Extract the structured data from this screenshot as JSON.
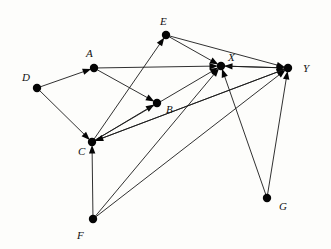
{
  "figure": {
    "type": "directed-graph",
    "width": 331,
    "height": 249,
    "background_color": "#fdfdfb",
    "node_color": "#050505",
    "edge_color": "#1a1a1a",
    "node_radius": 4.2,
    "label_style": "italic-serif"
  },
  "nodes": [
    {
      "id": "A",
      "label": "A",
      "x": 94,
      "y": 68,
      "label_x": 86,
      "label_y": 48
    },
    {
      "id": "B",
      "label": "B",
      "x": 157,
      "y": 103,
      "label_x": 166,
      "label_y": 104
    },
    {
      "id": "C",
      "label": "C",
      "x": 92,
      "y": 142,
      "label_x": 78,
      "label_y": 146
    },
    {
      "id": "D",
      "label": "D",
      "x": 37,
      "y": 88,
      "label_x": 22,
      "label_y": 72
    },
    {
      "id": "E",
      "label": "E",
      "x": 166,
      "y": 35,
      "label_x": 160,
      "label_y": 16
    },
    {
      "id": "F",
      "label": "F",
      "x": 93,
      "y": 219,
      "label_x": 77,
      "label_y": 230
    },
    {
      "id": "G",
      "label": "G",
      "x": 267,
      "y": 198,
      "label_x": 279,
      "label_y": 201
    },
    {
      "id": "X",
      "label": "X",
      "x": 221,
      "y": 66,
      "label_x": 228,
      "label_y": 52
    },
    {
      "id": "Y",
      "label": "Y",
      "x": 288,
      "y": 68,
      "label_x": 303,
      "label_y": 63
    }
  ],
  "edges": [
    {
      "from": "D",
      "to": "A",
      "arrow": true
    },
    {
      "from": "D",
      "to": "C",
      "arrow": true
    },
    {
      "from": "A",
      "to": "B",
      "arrow": true
    },
    {
      "from": "A",
      "to": "X",
      "arrow": true
    },
    {
      "from": "C",
      "to": "B",
      "arrow": true
    },
    {
      "from": "C",
      "to": "E",
      "arrow": true
    },
    {
      "from": "C",
      "to": "X",
      "arrow": true
    },
    {
      "from": "C",
      "to": "Y",
      "arrow": true
    },
    {
      "from": "E",
      "to": "X",
      "arrow": true
    },
    {
      "from": "E",
      "to": "Y",
      "arrow": true
    },
    {
      "from": "F",
      "to": "C",
      "arrow": true
    },
    {
      "from": "F",
      "to": "X",
      "arrow": true
    },
    {
      "from": "F",
      "to": "Y",
      "arrow": true
    },
    {
      "from": "G",
      "to": "X",
      "arrow": true
    },
    {
      "from": "G",
      "to": "Y",
      "arrow": true
    },
    {
      "from": "Y",
      "to": "X",
      "arrow": true
    },
    {
      "from": "Y",
      "to": "C",
      "arrow": true
    },
    {
      "from": "X",
      "to": "Y",
      "arrow": true
    }
  ]
}
